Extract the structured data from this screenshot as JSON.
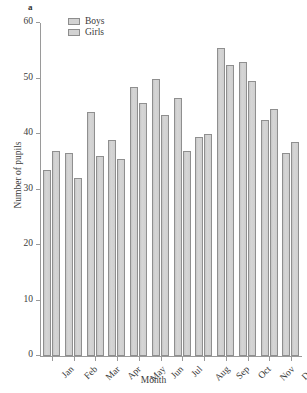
{
  "figure": {
    "panel_label": "a"
  },
  "legend": {
    "position": "top-left-inside",
    "items": [
      {
        "label": "Boys",
        "swatch_color": "#d2d2d2"
      },
      {
        "label": "Girls",
        "swatch_color": "#d2d2d2"
      }
    ]
  },
  "chart_data": {
    "type": "bar",
    "title": "",
    "subtitle": "",
    "xlabel": "Month",
    "ylabel": "Number of pupils",
    "categories": [
      "Jan",
      "Feb",
      "Mar",
      "Apr",
      "May",
      "Jun",
      "Jul",
      "Aug",
      "Sep",
      "Oct",
      "Nov",
      "Dec"
    ],
    "series": [
      {
        "name": "Boys",
        "values": [
          33.5,
          36.5,
          44.0,
          39.0,
          48.5,
          50.0,
          46.5,
          39.5,
          55.5,
          53.0,
          42.5,
          36.5
        ]
      },
      {
        "name": "Girls",
        "values": [
          37.0,
          32.0,
          36.0,
          35.5,
          45.5,
          43.5,
          37.0,
          40.0,
          52.5,
          49.5,
          44.5,
          38.5
        ]
      }
    ],
    "ylim": [
      0,
      60
    ],
    "yticks": [
      0,
      10,
      20,
      30,
      40,
      50,
      60
    ],
    "ytick_labels": [
      "0",
      "10",
      "20",
      "30",
      "40",
      "50",
      "60"
    ],
    "grid": false,
    "xtick_label_rotation": -45,
    "bar_fill": "#d2d2d2",
    "bar_edge": "#8f8f8f",
    "axis_color": "#9a9a9a"
  }
}
